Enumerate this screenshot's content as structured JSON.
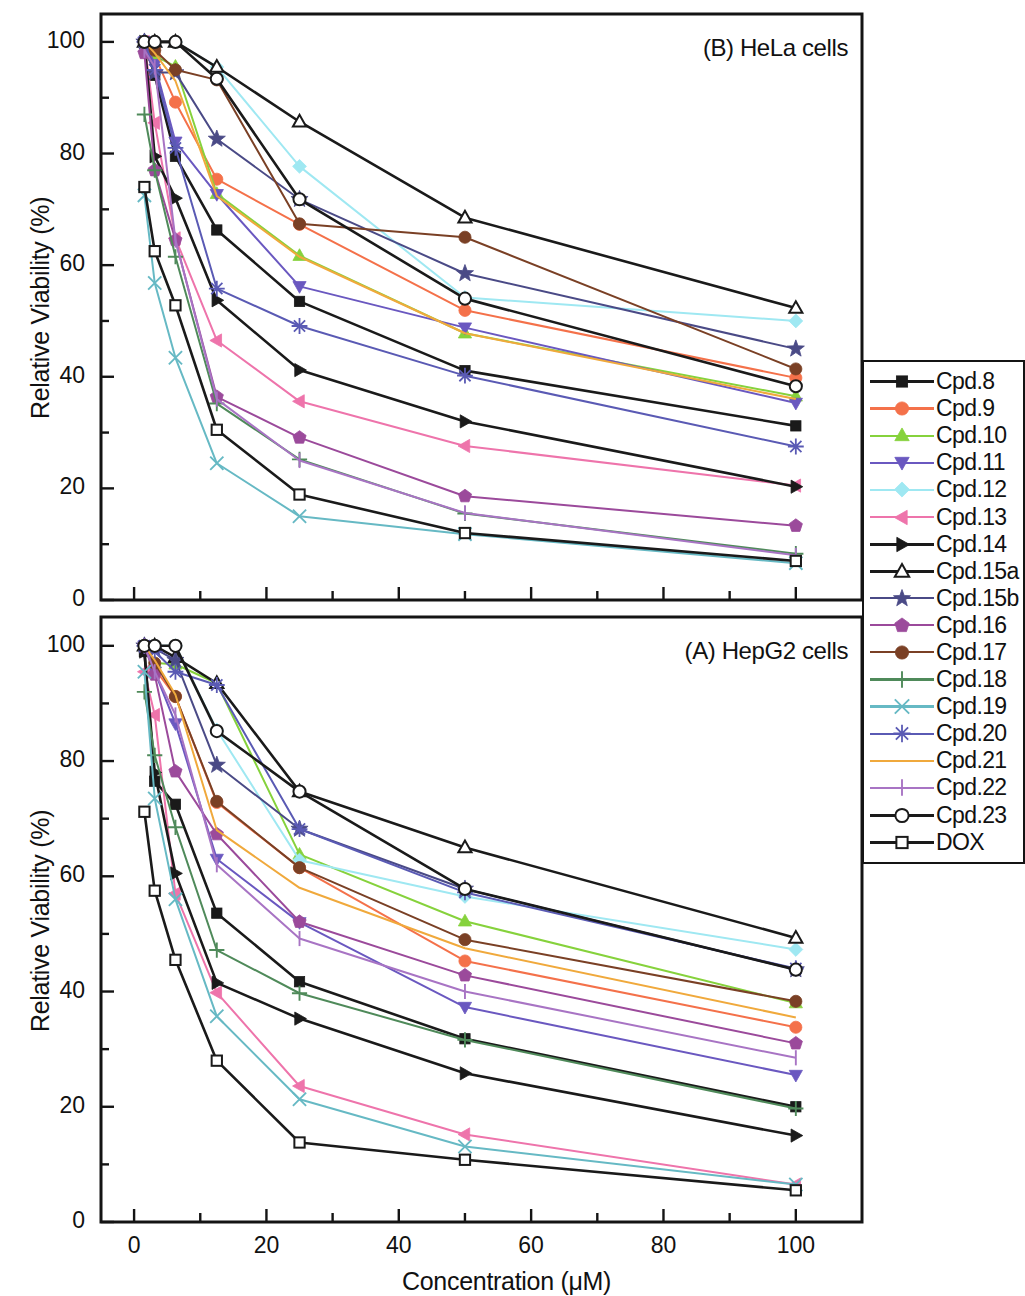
{
  "figure": {
    "width": 1025,
    "height": 1293,
    "xaxis_title": "Concentration (μM)",
    "yaxis_title": "Relative Viability (%)"
  },
  "panels": [
    {
      "id": "B",
      "title": "(B) HeLa cells"
    },
    {
      "id": "A",
      "title": "(A) HepG2 cells"
    }
  ],
  "legend": {
    "entries": [
      {
        "label": "Cpd.8",
        "color": "#1a1a1a",
        "marker": "square",
        "filled": true
      },
      {
        "label": "Cpd.9",
        "color": "#f4714a",
        "marker": "circle",
        "filled": true
      },
      {
        "label": "Cpd.10",
        "color": "#86d23c",
        "marker": "triangle-up",
        "filled": true
      },
      {
        "label": "Cpd.11",
        "color": "#6a58c0",
        "marker": "triangle-down",
        "filled": true
      },
      {
        "label": "Cpd.12",
        "color": "#9fe8f2",
        "marker": "diamond",
        "filled": true
      },
      {
        "label": "Cpd.13",
        "color": "#ee74ab",
        "marker": "triangle-left",
        "filled": true
      },
      {
        "label": "Cpd.14",
        "color": "#1a1a1a",
        "marker": "triangle-right",
        "filled": true
      },
      {
        "label": "Cpd.15a",
        "color": "#1a1a1a",
        "marker": "triangle-up",
        "filled": false
      },
      {
        "label": "Cpd.15b",
        "color": "#4a4a86",
        "marker": "star",
        "filled": true
      },
      {
        "label": "Cpd.16",
        "color": "#9b4a9b",
        "marker": "pentagon",
        "filled": true
      },
      {
        "label": "Cpd.17",
        "color": "#7a4025",
        "marker": "circle",
        "filled": true
      },
      {
        "label": "Cpd.18",
        "color": "#4f8a5a",
        "marker": "plus",
        "filled": true
      },
      {
        "label": "Cpd.19",
        "color": "#66b9c4",
        "marker": "cross",
        "filled": true
      },
      {
        "label": "Cpd.20",
        "color": "#5a5ab4",
        "marker": "asterisk",
        "filled": true
      },
      {
        "label": "Cpd.21",
        "color": "#f0a93c",
        "marker": "none",
        "filled": true
      },
      {
        "label": "Cpd.22",
        "color": "#a874c4",
        "marker": "bar",
        "filled": true
      },
      {
        "label": "Cpd.23",
        "color": "#1a1a1a",
        "marker": "circle",
        "filled": false
      },
      {
        "label": "DOX",
        "color": "#1a1a1a",
        "marker": "square",
        "filled": false
      }
    ]
  },
  "chart_data": [
    {
      "type": "line",
      "panel": "B",
      "title": "(B) HeLa cells",
      "xlabel": "Concentration (μM)",
      "ylabel": "Relative Viability (%)",
      "xlim": [
        -5,
        110
      ],
      "ylim": [
        0,
        105
      ],
      "xticks": [
        0,
        20,
        40,
        60,
        80,
        100
      ],
      "yticks": [
        0,
        20,
        40,
        60,
        80,
        100
      ],
      "grid": false,
      "legend_position": "right-outside",
      "x": [
        1.56,
        3.12,
        6.25,
        12.5,
        25,
        50,
        100
      ],
      "series": [
        {
          "name": "Cpd.8",
          "values": [
            100,
            94,
            79.5,
            66.3,
            53.5,
            41.1,
            31.2
          ]
        },
        {
          "name": "Cpd.9",
          "values": [
            100,
            97.5,
            89.2,
            75.4,
            67.3,
            51.9,
            39.8
          ]
        },
        {
          "name": "Cpd.10",
          "values": [
            100,
            97.5,
            95.6,
            72.8,
            61.7,
            47.8,
            36.5
          ]
        },
        {
          "name": "Cpd.11",
          "values": [
            100,
            96.0,
            82.1,
            72.7,
            56.2,
            48.8,
            35.3
          ]
        },
        {
          "name": "Cpd.12",
          "values": [
            100,
            100,
            100,
            95.5,
            77.7,
            54.2,
            50.0
          ]
        },
        {
          "name": "Cpd.13",
          "values": [
            100,
            85.5,
            64.8,
            46.5,
            35.6,
            27.6,
            20.5
          ]
        },
        {
          "name": "Cpd.14",
          "values": [
            100,
            79.5,
            72.0,
            53.7,
            41.2,
            32.0,
            20.3
          ]
        },
        {
          "name": "Cpd.15a",
          "values": [
            100,
            100,
            100,
            95.5,
            85.7,
            68.5,
            52.3
          ]
        },
        {
          "name": "Cpd.15b",
          "values": [
            100,
            94.5,
            94.5,
            82.6,
            71.8,
            58.5,
            45.0
          ]
        },
        {
          "name": "Cpd.16",
          "values": [
            98.0,
            77.0,
            64.5,
            36.4,
            29.1,
            18.6,
            13.3
          ]
        },
        {
          "name": "Cpd.17",
          "values": [
            100,
            98.5,
            95.0,
            93.2,
            67.4,
            65.0,
            41.4
          ]
        },
        {
          "name": "Cpd.18",
          "values": [
            87.0,
            77.0,
            61.5,
            35.2,
            25.2,
            15.5,
            8.3
          ]
        },
        {
          "name": "Cpd.19",
          "values": [
            72.5,
            56.8,
            43.4,
            24.5,
            15.0,
            11.8,
            6.6
          ]
        },
        {
          "name": "Cpd.20",
          "values": [
            100,
            95.0,
            81.0,
            55.8,
            49.1,
            40.2,
            27.5
          ]
        },
        {
          "name": "Cpd.21",
          "values": [
            100,
            98.0,
            93.0,
            72.4,
            61.5,
            47.8,
            36.0
          ]
        },
        {
          "name": "Cpd.22",
          "values": [
            98.5,
            95.5,
            64.5,
            36.0,
            25.0,
            15.6,
            8.0
          ]
        },
        {
          "name": "Cpd.23",
          "values": [
            100,
            100,
            100,
            93.4,
            71.8,
            54.0,
            38.3
          ]
        },
        {
          "name": "DOX",
          "values": [
            74.0,
            62.5,
            52.8,
            30.5,
            18.9,
            12.0,
            7.0
          ]
        }
      ]
    },
    {
      "type": "line",
      "panel": "A",
      "title": "(A) HepG2 cells",
      "xlabel": "Concentration (μM)",
      "ylabel": "Relative Viability (%)",
      "xlim": [
        -5,
        110
      ],
      "ylim": [
        0,
        105
      ],
      "xticks": [
        0,
        20,
        40,
        60,
        80,
        100
      ],
      "yticks": [
        0,
        20,
        40,
        60,
        80,
        100
      ],
      "grid": false,
      "legend_position": "right-outside",
      "x": [
        1.56,
        3.12,
        6.25,
        12.5,
        25,
        50,
        100
      ],
      "series": [
        {
          "name": "Cpd.8",
          "values": [
            99.0,
            76.5,
            72.5,
            53.6,
            41.7,
            31.8,
            20.0
          ]
        },
        {
          "name": "Cpd.9",
          "values": [
            100,
            96.0,
            91.2,
            72.8,
            61.5,
            45.3,
            33.8
          ]
        },
        {
          "name": "Cpd.10",
          "values": [
            100,
            97.0,
            96.8,
            93.5,
            63.8,
            52.2,
            38.0
          ]
        },
        {
          "name": "Cpd.11",
          "values": [
            100,
            95.5,
            86.5,
            63.0,
            52.0,
            37.3,
            25.5
          ]
        },
        {
          "name": "Cpd.12",
          "values": [
            100,
            100,
            100,
            85.4,
            62.8,
            56.5,
            47.3
          ]
        },
        {
          "name": "Cpd.13",
          "values": [
            95.5,
            88.0,
            57.0,
            39.8,
            23.6,
            15.2,
            6.5
          ]
        },
        {
          "name": "Cpd.14",
          "values": [
            99.0,
            78.0,
            60.5,
            41.5,
            35.3,
            25.8,
            15.0
          ]
        },
        {
          "name": "Cpd.15a",
          "values": [
            100,
            100,
            98.0,
            93.5,
            74.7,
            65.0,
            49.3
          ]
        },
        {
          "name": "Cpd.15b",
          "values": [
            100,
            99.5,
            97.5,
            79.3,
            68.2,
            57.8,
            43.8
          ]
        },
        {
          "name": "Cpd.16",
          "values": [
            100,
            95.0,
            78.2,
            67.3,
            52.1,
            42.8,
            31.0
          ]
        },
        {
          "name": "Cpd.17",
          "values": [
            100,
            97.0,
            91.2,
            73.0,
            61.5,
            49.0,
            38.3
          ]
        },
        {
          "name": "Cpd.18",
          "values": [
            92.0,
            81.0,
            68.5,
            47.2,
            39.7,
            31.6,
            19.7
          ]
        },
        {
          "name": "Cpd.19",
          "values": [
            95.5,
            73.5,
            56.0,
            35.7,
            21.3,
            13.1,
            6.5
          ]
        },
        {
          "name": "Cpd.20",
          "values": [
            100,
            99.0,
            95.5,
            93.2,
            68.2,
            57.2,
            44.0
          ]
        },
        {
          "name": "Cpd.21",
          "values": [
            100,
            97.5,
            91.5,
            68.0,
            58.0,
            47.5,
            35.5
          ]
        },
        {
          "name": "Cpd.22",
          "values": [
            100,
            95.5,
            88.0,
            62.0,
            49.2,
            40.0,
            28.5
          ]
        },
        {
          "name": "Cpd.23",
          "values": [
            100,
            100,
            100,
            85.2,
            74.7,
            57.8,
            43.8
          ]
        },
        {
          "name": "DOX",
          "values": [
            71.2,
            57.5,
            45.5,
            28.0,
            13.8,
            10.8,
            5.5
          ]
        }
      ]
    }
  ]
}
